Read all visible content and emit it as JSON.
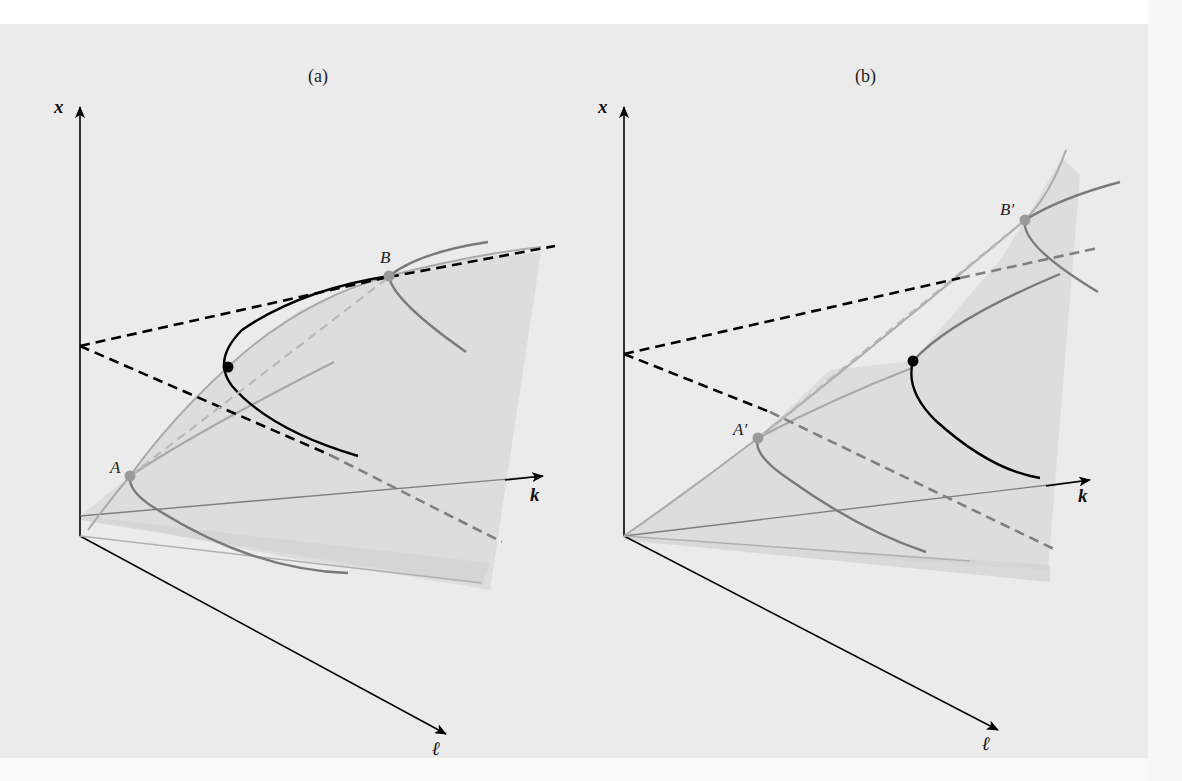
{
  "figure": {
    "panels": [
      {
        "id": "a",
        "title": "(a)",
        "axes": {
          "vertical": "x",
          "right": "k",
          "down": "ℓ"
        },
        "points": [
          {
            "label": "A",
            "color": "#9a9a9a"
          },
          {
            "label": "B",
            "color": "#9a9a9a"
          },
          {
            "label": "",
            "color": "#000000"
          }
        ]
      },
      {
        "id": "b",
        "title": "(b)",
        "axes": {
          "vertical": "x",
          "right": "k",
          "down": "ℓ"
        },
        "points": [
          {
            "label": "A′",
            "color": "#9a9a9a"
          },
          {
            "label": "B′",
            "color": "#9a9a9a"
          },
          {
            "label": "",
            "color": "#000000"
          }
        ]
      }
    ],
    "colors": {
      "surface_fill": "#dcdcdc",
      "axis": "#000000",
      "curve_dark": "#7a7a7a",
      "curve_light": "#a8a8a8",
      "dash_black": "#000000",
      "dash_gray": "#8a8a8a",
      "dash_light": "#b3b3b3"
    }
  }
}
